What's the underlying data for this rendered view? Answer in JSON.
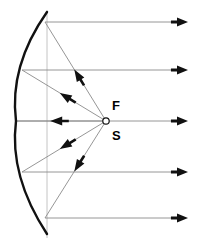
{
  "diagram": {
    "type": "optics-ray-diagram",
    "canvas": {
      "width": 198,
      "height": 247,
      "background": "#ffffff"
    },
    "colors": {
      "mirror": "#111111",
      "ray": "#8a8a8a",
      "arrowhead": "#111111",
      "label": "#000000",
      "aperture_line": "#bdbdbd"
    },
    "labels": {
      "focus": "F",
      "source": "S"
    },
    "focus_point": {
      "x": 106,
      "y": 121,
      "radius": 3.2
    },
    "label_positions": {
      "focus": {
        "x": 112,
        "y": 110
      },
      "source": {
        "x": 112,
        "y": 140
      }
    },
    "mirror": {
      "name": "parabolic-mirror",
      "vertex": {
        "x": 16,
        "y": 121
      },
      "top_end": {
        "x": 47,
        "y": 12
      },
      "bottom_end": {
        "x": 47,
        "y": 234
      },
      "path": "M 47 12 Q 9 66 16 121 Q 9 176 47 234",
      "stroke_width": 2.4
    },
    "optical_axis": {
      "y": 121,
      "x_start": 16,
      "x_end": 188
    },
    "aperture_line": {
      "x": 47,
      "y_start": 10,
      "y_end": 238
    },
    "reflection_points": [
      {
        "id": "top-outer",
        "x": 45,
        "y": 22
      },
      {
        "id": "top-inner",
        "x": 22,
        "y": 70
      },
      {
        "id": "vertex",
        "x": 16,
        "y": 121
      },
      {
        "id": "bot-inner",
        "x": 22,
        "y": 172
      },
      {
        "id": "bot-outer",
        "x": 45,
        "y": 218
      }
    ],
    "incident_rays": [
      {
        "id": "incident-top-outer",
        "from": {
          "x": 106,
          "y": 121
        },
        "to": {
          "x": 45,
          "y": 22
        },
        "arrow_at": 0.52
      },
      {
        "id": "incident-top-inner",
        "from": {
          "x": 106,
          "y": 121
        },
        "to": {
          "x": 22,
          "y": 70
        },
        "arrow_at": 0.55
      },
      {
        "id": "incident-vertex",
        "from": {
          "x": 106,
          "y": 121
        },
        "to": {
          "x": 16,
          "y": 121
        },
        "arrow_at": 0.62
      },
      {
        "id": "incident-bot-inner",
        "from": {
          "x": 106,
          "y": 121
        },
        "to": {
          "x": 22,
          "y": 172
        },
        "arrow_at": 0.55
      },
      {
        "id": "incident-bot-outer",
        "from": {
          "x": 106,
          "y": 121
        },
        "to": {
          "x": 45,
          "y": 218
        },
        "arrow_at": 0.52
      }
    ],
    "reflected_rays": [
      {
        "id": "reflected-ray-1",
        "y": 22,
        "x_start": 45,
        "x_end": 188
      },
      {
        "id": "reflected-ray-2",
        "y": 70,
        "x_start": 22,
        "x_end": 188
      },
      {
        "id": "reflected-ray-3",
        "y": 121,
        "x_start": 16,
        "x_end": 188
      },
      {
        "id": "reflected-ray-4",
        "y": 172,
        "x_start": 22,
        "x_end": 188
      },
      {
        "id": "reflected-ray-5",
        "y": 218,
        "x_start": 45,
        "x_end": 188
      }
    ]
  }
}
